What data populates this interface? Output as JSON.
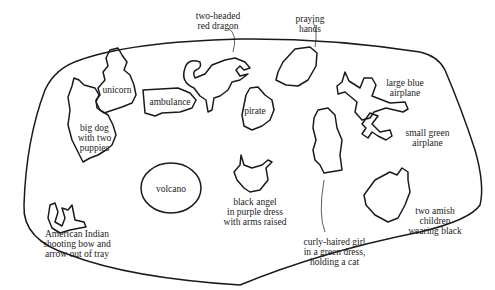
{
  "diagram": {
    "labels": {
      "two_headed_dragon": "two-headed\nred dragon",
      "praying_hands": "praying\nhands",
      "unicorn": "unicorn",
      "ambulance": "ambulance",
      "pirate": "pirate",
      "large_blue_airplane": "large blue\nairplane",
      "small_green_airplane": "small green\nairplane",
      "big_dog": "big dog\nwith two\npuppies",
      "volcano": "volcano",
      "black_angel": "black angel\nin purple dress\nwith arms raised",
      "curly_haired_girl": "curly-haired girl\nin a green dress,\nholding a cat",
      "two_amish_children": "two amish\nchildren\nwearing black",
      "american_indian": "American Indian\nshooting bow and\narrow out of tray"
    }
  }
}
